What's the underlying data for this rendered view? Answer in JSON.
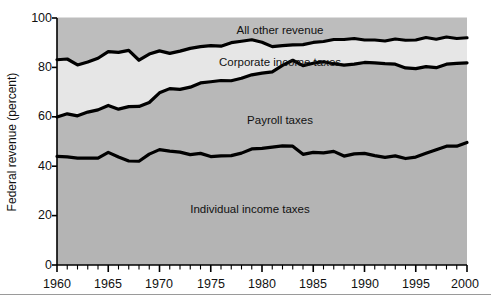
{
  "chart_data": {
    "type": "area",
    "title": "",
    "subtitle": "",
    "xlabel": "",
    "ylabel": "Federal revenue (percent)",
    "stacked": true,
    "grid": false,
    "legend_position": "inline-labels",
    "xlim": [
      1960,
      2000
    ],
    "ylim": [
      0,
      100
    ],
    "y_ticks": [
      0,
      20,
      40,
      60,
      80,
      100
    ],
    "y_tick_labels": [
      "0",
      "20",
      "40",
      "60",
      "80",
      "100"
    ],
    "x_ticks": [
      1960,
      1965,
      1970,
      1975,
      1980,
      1985,
      1990,
      1995,
      2000
    ],
    "x_tick_labels": [
      "1960",
      "1965",
      "1970",
      "1975",
      "1980",
      "1985",
      "1990",
      "1995",
      "2000"
    ],
    "x_minor_tick_interval": 1,
    "x": [
      1960,
      1961,
      1962,
      1963,
      1964,
      1965,
      1966,
      1967,
      1968,
      1969,
      1970,
      1971,
      1972,
      1973,
      1974,
      1975,
      1976,
      1977,
      1978,
      1979,
      1980,
      1981,
      1982,
      1983,
      1984,
      1985,
      1986,
      1987,
      1988,
      1989,
      1990,
      1991,
      1992,
      1993,
      1994,
      1995,
      1996,
      1997,
      1998,
      1999,
      2000
    ],
    "series": [
      {
        "name": "Individual income taxes",
        "color": "#b4b4b4",
        "label_position": {
          "x": 1975.5,
          "y": 26
        },
        "values": [
          44.0,
          43.8,
          43.3,
          43.3,
          43.3,
          45.6,
          43.7,
          42.1,
          42.0,
          44.9,
          46.7,
          46.1,
          45.7,
          44.7,
          45.2,
          43.9,
          44.2,
          44.3,
          45.3,
          47.0,
          47.2,
          47.7,
          48.2,
          48.1,
          44.8,
          45.6,
          45.4,
          46.0,
          44.1,
          45.0,
          45.2,
          44.3,
          43.6,
          44.2,
          43.1,
          43.7,
          45.2,
          46.7,
          48.1,
          48.1,
          49.6
        ]
      },
      {
        "name": "Payroll taxes",
        "color": "#b8b8b8",
        "label_position": {
          "x": 1976,
          "y": 57
        },
        "values": [
          15.9,
          17.4,
          17.1,
          18.6,
          19.5,
          19.0,
          19.4,
          22.0,
          22.2,
          20.9,
          23.0,
          25.3,
          25.4,
          27.3,
          28.5,
          30.3,
          30.5,
          30.3,
          30.3,
          30.0,
          30.5,
          30.5,
          32.6,
          34.8,
          35.9,
          36.1,
          36.9,
          35.5,
          36.8,
          36.3,
          36.8,
          37.5,
          37.9,
          37.1,
          36.7,
          35.8,
          35.1,
          33.2,
          33.2,
          33.5,
          32.2
        ]
      },
      {
        "name": "Corporate income taxes",
        "color": "#e6e6e6",
        "label_position": {
          "x": 1978,
          "y": 81
        },
        "values": [
          23.2,
          22.2,
          20.6,
          20.3,
          20.9,
          21.8,
          23.0,
          22.8,
          18.7,
          19.6,
          17.0,
          14.3,
          15.5,
          15.7,
          14.7,
          14.6,
          13.9,
          15.4,
          15.0,
          14.2,
          12.5,
          10.2,
          8.0,
          6.2,
          8.5,
          8.4,
          8.2,
          9.8,
          10.4,
          10.4,
          9.1,
          9.3,
          9.2,
          10.2,
          11.2,
          11.6,
          11.8,
          11.5,
          11.0,
          10.1,
          10.2
        ]
      },
      {
        "name": "All other revenue",
        "color": "#bdbdbd",
        "label_position": {
          "x": 1978,
          "y": 93
        },
        "values": [
          16.9,
          16.6,
          19.0,
          17.8,
          16.3,
          13.6,
          13.9,
          13.1,
          17.1,
          14.6,
          13.3,
          14.3,
          13.4,
          12.3,
          11.6,
          11.2,
          11.4,
          10.0,
          9.4,
          8.8,
          9.8,
          11.6,
          11.2,
          10.9,
          10.8,
          9.9,
          9.5,
          8.7,
          8.7,
          8.3,
          8.9,
          8.9,
          9.3,
          8.5,
          9.0,
          8.9,
          7.9,
          8.6,
          7.7,
          8.3,
          8.0
        ]
      }
    ],
    "boundaries_cumulative": {
      "individual_top": [
        44.0,
        43.8,
        43.3,
        43.3,
        43.3,
        45.6,
        43.7,
        42.1,
        42.0,
        44.9,
        46.7,
        46.1,
        45.7,
        44.7,
        45.2,
        43.9,
        44.2,
        44.3,
        45.3,
        47.0,
        47.2,
        47.7,
        48.2,
        48.1,
        44.8,
        45.6,
        45.4,
        46.0,
        44.1,
        45.0,
        45.2,
        44.3,
        43.6,
        44.2,
        43.1,
        43.7,
        45.2,
        46.7,
        48.1,
        48.1,
        49.6
      ],
      "payroll_top": [
        59.9,
        61.2,
        60.4,
        61.9,
        62.8,
        64.6,
        63.1,
        64.1,
        64.2,
        65.8,
        69.7,
        71.4,
        71.1,
        72.0,
        73.7,
        74.2,
        74.7,
        74.6,
        75.6,
        77.0,
        77.7,
        78.2,
        80.8,
        82.9,
        80.7,
        81.7,
        82.3,
        81.5,
        80.9,
        81.3,
        82.0,
        81.8,
        81.5,
        81.3,
        79.8,
        79.5,
        80.3,
        79.9,
        81.3,
        81.6,
        81.8
      ],
      "corporate_top": [
        83.1,
        83.4,
        81.0,
        82.2,
        83.7,
        86.4,
        86.1,
        86.9,
        82.9,
        85.4,
        86.7,
        85.7,
        86.6,
        87.7,
        88.4,
        88.8,
        88.6,
        90.0,
        90.6,
        91.2,
        90.2,
        88.4,
        88.8,
        89.1,
        89.2,
        90.1,
        90.5,
        91.3,
        91.3,
        91.7,
        91.1,
        91.1,
        90.7,
        91.5,
        91.0,
        91.1,
        92.1,
        91.4,
        92.3,
        91.7,
        92.0
      ],
      "total_top": [
        100,
        100,
        100,
        100,
        100,
        100,
        100,
        100,
        100,
        100,
        100,
        100,
        100,
        100,
        100,
        100,
        100,
        100,
        100,
        100,
        100,
        100,
        100,
        100,
        100,
        100,
        100,
        100,
        100,
        100,
        100,
        100,
        100,
        100,
        100,
        100,
        100,
        100,
        100,
        100,
        100
      ]
    }
  },
  "colors": {
    "all_other_revenue": "#bdbdbd",
    "corporate_income_taxes": "#e6e6e6",
    "payroll_taxes": "#b8b8b8",
    "individual_income_taxes": "#b4b4b4",
    "boundary_line": "#000000",
    "axis": "#000000",
    "text": "#111111",
    "page_background": "#ffffff"
  },
  "labels": {
    "y_axis_title": "Federal revenue (percent)",
    "band_all_other_revenue": "All other revenue",
    "band_corporate_income_taxes": "Corporate income taxes",
    "band_payroll_taxes": "Payroll taxes",
    "band_individual_income_taxes": "Individual income taxes",
    "y0": "0",
    "y20": "20",
    "y40": "40",
    "y60": "60",
    "y80": "80",
    "y100": "100",
    "x1960": "1960",
    "x1965": "1965",
    "x1970": "1970",
    "x1975": "1975",
    "x1980": "1980",
    "x1985": "1985",
    "x1990": "1990",
    "x1995": "1995",
    "x2000": "2000"
  }
}
